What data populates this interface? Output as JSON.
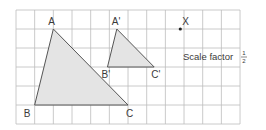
{
  "diagram": {
    "grid": {
      "x0": 16,
      "y0": 10,
      "cols": 12,
      "rows": 6,
      "cell_w": 18.67,
      "cell_h": 19
    },
    "colors": {
      "grid": "#bdbdbd",
      "fill": "#e4e4e4",
      "stroke": "#555555",
      "text": "#3a3a3a"
    },
    "triangle_original": {
      "vertices": [
        {
          "label": "A",
          "col": 2,
          "row": 1
        },
        {
          "label": "B",
          "col": 1,
          "row": 5
        },
        {
          "label": "C",
          "col": 6,
          "row": 5
        }
      ]
    },
    "triangle_image": {
      "vertices": [
        {
          "label": "A'",
          "col": 5.4,
          "row": 1
        },
        {
          "label": "B'",
          "col": 4.9,
          "row": 3
        },
        {
          "label": "C'",
          "col": 7.4,
          "row": 3
        }
      ]
    },
    "center": {
      "label": "X",
      "col": 8.8,
      "row": 1
    },
    "scale_factor": {
      "text": "Scale factor",
      "numerator": "1",
      "denominator": "2"
    }
  }
}
